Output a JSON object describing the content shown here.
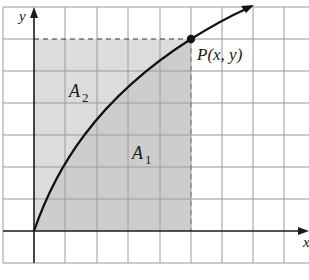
{
  "diagram": {
    "axes": {
      "x_label": "x",
      "y_label": "y"
    },
    "point": {
      "label": "P(x, y)"
    },
    "regions": [
      {
        "name": "A",
        "subscript": "2",
        "description": "area above curve, left of P, below horizontal dashed line"
      },
      {
        "name": "A",
        "subscript": "1",
        "description": "area under curve from origin to x"
      }
    ],
    "colors": {
      "grid": "#9a9a9a",
      "axis": "#1a1a1a",
      "shade_a2": "#dcdcdc",
      "shade_a1": "#cdcdcd",
      "curve": "#111111"
    },
    "grid": {
      "columns": 10,
      "rows": 8,
      "cell_px": 31.5
    }
  }
}
